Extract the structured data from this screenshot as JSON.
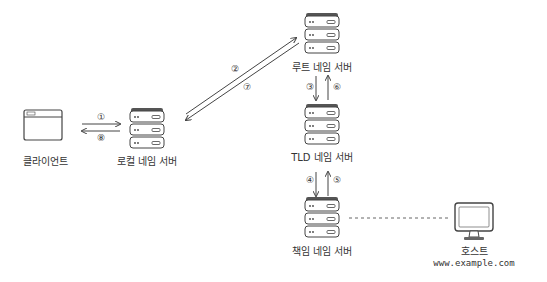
{
  "nodes": {
    "client": {
      "label": "클라이언트"
    },
    "local_dns": {
      "label": "로컬 네임 서버"
    },
    "root_dns": {
      "label": "루트 네임 서버"
    },
    "tld_dns": {
      "label": "TLD 네임 서버"
    },
    "auth_dns": {
      "label": "책임 네임 서버"
    },
    "host": {
      "label": "호스트",
      "domain": "www.example.com"
    }
  },
  "steps": [
    "①",
    "②",
    "③",
    "④",
    "⑤",
    "⑥",
    "⑦",
    "⑧"
  ],
  "colors": {
    "stroke": "#444444",
    "server_top": "#555555",
    "background": "#ffffff"
  }
}
